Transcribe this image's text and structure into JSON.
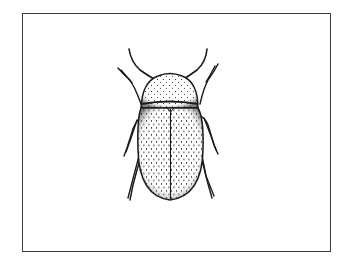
{
  "image": {
    "subject": "beetle illustration",
    "style": "black-and-white pen stipple drawing",
    "colors": {
      "background": "#ffffff",
      "frame": "#3a3a3a",
      "ink": "#1a1a1a"
    }
  }
}
